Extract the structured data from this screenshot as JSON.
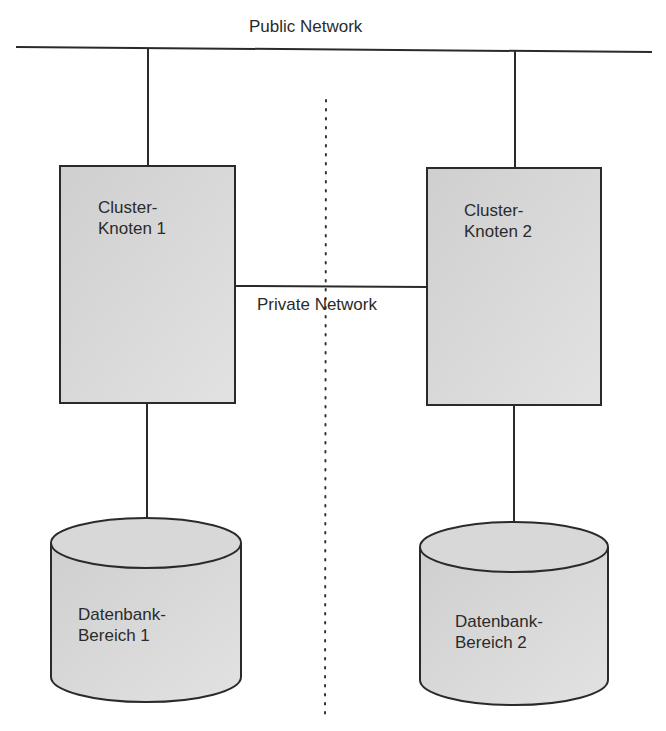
{
  "public_network": {
    "label": "Public Network"
  },
  "private_network": {
    "label": "Private Network"
  },
  "nodes": [
    {
      "line1": "Cluster-",
      "line2": "Knoten 1"
    },
    {
      "line1": "Cluster-",
      "line2": "Knoten 2"
    }
  ],
  "databases": [
    {
      "line1": "Datenbank-",
      "line2": "Bereich 1"
    },
    {
      "line1": "Datenbank-",
      "line2": "Bereich 2"
    }
  ],
  "colors": {
    "line": "#2a2a2a",
    "fill": "#d4d4d4",
    "background": "#ffffff"
  }
}
